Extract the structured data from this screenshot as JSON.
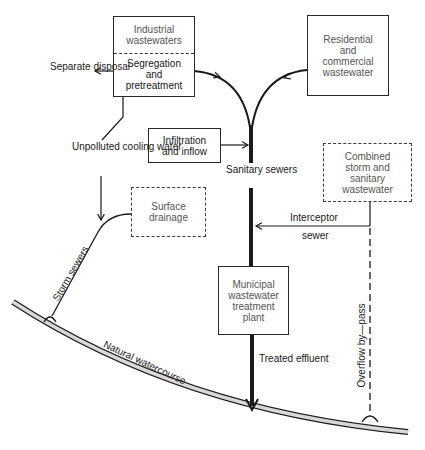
{
  "diagram": {
    "boxes": {
      "industrial": {
        "top_lines": [
          "Industrial",
          "wastewaters"
        ],
        "bottom_lines": [
          "Segregation",
          "and",
          "pretreatment"
        ],
        "style": "solid, dashed divider"
      },
      "residential": {
        "lines": [
          "Residential",
          "and",
          "commercial",
          "wastewater"
        ],
        "style": "solid"
      },
      "infiltration": {
        "lines": [
          "Infiltration",
          "and inflow"
        ],
        "style": "solid"
      },
      "combined": {
        "lines": [
          "Combined",
          "storm and",
          "sanitary",
          "wastewater"
        ],
        "style": "dashed"
      },
      "surface": {
        "lines": [
          "Surface",
          "drainage"
        ],
        "style": "dashed"
      },
      "municipal": {
        "lines": [
          "Municipal",
          "wastewater",
          "treatment",
          "plant"
        ],
        "style": "solid"
      }
    },
    "labels": {
      "separate_disposal": [
        "Separate",
        "disposal"
      ],
      "unpolluted": [
        "Unpolluted",
        "cooling",
        "water"
      ],
      "sanitary_sewers": [
        "Sanitary",
        "sewers"
      ],
      "interceptor": "Interceptor",
      "sewer": "sewer",
      "storm_sewers": "Storm sewers",
      "natural_watercourse": "Natural watercourse",
      "treated_effluent": [
        "Treated",
        "effluent"
      ],
      "overflow": "Overflow by—pass"
    },
    "colors": {
      "line": "#1a1a1a",
      "river_fill": "#d8d8d8",
      "background": "#ffffff"
    }
  }
}
